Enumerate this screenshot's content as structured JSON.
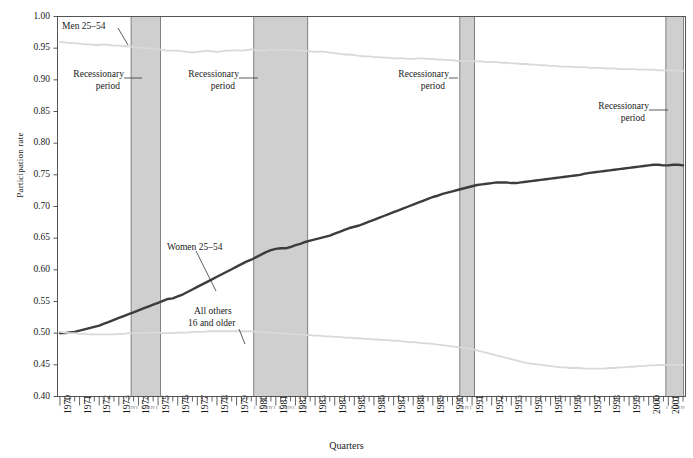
{
  "chart_data": {
    "type": "line",
    "title": "",
    "xlabel": "Quarters",
    "ylabel": "Participation rate",
    "ylim": [
      0.4,
      1.0
    ],
    "ytick_labels": [
      "0.40",
      "0.45",
      "0.50",
      "0.55",
      "0.60",
      "0.65",
      "0.70",
      "0.75",
      "0.80",
      "0.85",
      "0.90",
      "0.95",
      "1.00"
    ],
    "ytick_values": [
      0.4,
      0.45,
      0.5,
      0.55,
      0.6,
      0.65,
      0.7,
      0.75,
      0.8,
      0.85,
      0.9,
      0.95,
      1.0
    ],
    "grid": false,
    "legend_position": "inline-annotations",
    "x_unit": "quarter",
    "x_start_year": 1970,
    "x_end_year": 2001,
    "xtick_years": [
      "1970",
      "1971",
      "1972",
      "1973",
      "1974",
      "1975",
      "1976",
      "1977",
      "1978",
      "1979",
      "1980",
      "1981",
      "1982",
      "1983",
      "1984",
      "1985",
      "1986",
      "1987",
      "1988",
      "1989",
      "1990",
      "1991",
      "1992",
      "1993",
      "1994",
      "1995",
      "1996",
      "1997",
      "1998",
      "1999",
      "2000",
      "2001"
    ],
    "quarter_tick_labels": [
      "I",
      "II",
      "III",
      "IV"
    ],
    "recession_bands": [
      {
        "label": "Recessionary period",
        "start_year": 1973.75,
        "end_year": 1975.25,
        "quarters": "I II III IV I II III IV"
      },
      {
        "label": "Recessionary period",
        "start_year": 1980.0,
        "end_year": 1982.75,
        "quarters": "I II III IV I II III IV I II III IV"
      },
      {
        "label": "Recessionary period",
        "start_year": 1990.5,
        "end_year": 1991.25,
        "quarters": "I II III IV"
      },
      {
        "label": "Recessionary period",
        "start_year": 2001.0,
        "end_year": 2001.9,
        "quarters": "I II III IV"
      }
    ],
    "band_color": "#cfcfcf",
    "series": [
      {
        "name": "Men 25–54",
        "color": "#d9d9d9",
        "label_text": "Men 25–54",
        "values": [
          0.96,
          0.959,
          0.958,
          0.958,
          0.957,
          0.956,
          0.956,
          0.955,
          0.955,
          0.956,
          0.955,
          0.954,
          0.954,
          0.953,
          0.953,
          0.952,
          0.951,
          0.95,
          0.95,
          0.949,
          0.948,
          0.947,
          0.946,
          0.946,
          0.946,
          0.945,
          0.944,
          0.943,
          0.944,
          0.945,
          0.946,
          0.945,
          0.944,
          0.945,
          0.946,
          0.946,
          0.947,
          0.946,
          0.947,
          0.948,
          0.947,
          0.946,
          0.947,
          0.948,
          0.947,
          0.947,
          0.948,
          0.947,
          0.946,
          0.947,
          0.946,
          0.945,
          0.944,
          0.945,
          0.944,
          0.943,
          0.942,
          0.941,
          0.94,
          0.94,
          0.939,
          0.938,
          0.937,
          0.937,
          0.936,
          0.936,
          0.935,
          0.935,
          0.934,
          0.934,
          0.934,
          0.933,
          0.933,
          0.934,
          0.934,
          0.933,
          0.933,
          0.932,
          0.932,
          0.931,
          0.931,
          0.93,
          0.93,
          0.93,
          0.929,
          0.929,
          0.929,
          0.928,
          0.928,
          0.928,
          0.927,
          0.927,
          0.926,
          0.926,
          0.925,
          0.925,
          0.924,
          0.924,
          0.923,
          0.923,
          0.922,
          0.922,
          0.921,
          0.921,
          0.921,
          0.92,
          0.92,
          0.92,
          0.919,
          0.919,
          0.919,
          0.918,
          0.918,
          0.918,
          0.917,
          0.917,
          0.917,
          0.917,
          0.916,
          0.916,
          0.916,
          0.916,
          0.915,
          0.915,
          0.915,
          0.915,
          0.914,
          0.914
        ]
      },
      {
        "name": "Women 25–54",
        "color": "#3c3c3c",
        "label_text": "Women 25–54",
        "values": [
          0.5,
          0.5,
          0.501,
          0.502,
          0.504,
          0.506,
          0.508,
          0.51,
          0.512,
          0.515,
          0.518,
          0.521,
          0.524,
          0.527,
          0.53,
          0.533,
          0.536,
          0.539,
          0.542,
          0.545,
          0.548,
          0.551,
          0.554,
          0.555,
          0.558,
          0.561,
          0.565,
          0.569,
          0.573,
          0.577,
          0.581,
          0.585,
          0.589,
          0.593,
          0.597,
          0.601,
          0.605,
          0.609,
          0.613,
          0.616,
          0.62,
          0.624,
          0.628,
          0.631,
          0.633,
          0.634,
          0.634,
          0.636,
          0.639,
          0.641,
          0.644,
          0.646,
          0.648,
          0.65,
          0.652,
          0.654,
          0.657,
          0.66,
          0.663,
          0.666,
          0.668,
          0.67,
          0.673,
          0.676,
          0.679,
          0.682,
          0.685,
          0.688,
          0.691,
          0.694,
          0.697,
          0.7,
          0.703,
          0.706,
          0.709,
          0.712,
          0.715,
          0.717,
          0.72,
          0.722,
          0.724,
          0.726,
          0.728,
          0.73,
          0.732,
          0.734,
          0.735,
          0.736,
          0.737,
          0.738,
          0.738,
          0.738,
          0.737,
          0.737,
          0.738,
          0.739,
          0.74,
          0.741,
          0.742,
          0.743,
          0.744,
          0.745,
          0.746,
          0.747,
          0.748,
          0.749,
          0.75,
          0.752,
          0.753,
          0.754,
          0.755,
          0.756,
          0.757,
          0.758,
          0.759,
          0.76,
          0.761,
          0.762,
          0.763,
          0.764,
          0.765,
          0.766,
          0.766,
          0.765,
          0.765,
          0.766,
          0.766,
          0.765
        ]
      },
      {
        "name": "All others 16 and older",
        "color": "#d9d9d9",
        "label_text": "All others\n16 and older",
        "values": [
          0.502,
          0.501,
          0.5,
          0.5,
          0.499,
          0.499,
          0.498,
          0.498,
          0.498,
          0.498,
          0.498,
          0.498,
          0.499,
          0.499,
          0.5,
          0.5,
          0.5,
          0.5,
          0.501,
          0.501,
          0.501,
          0.5,
          0.5,
          0.5,
          0.501,
          0.501,
          0.501,
          0.502,
          0.502,
          0.502,
          0.503,
          0.503,
          0.503,
          0.503,
          0.503,
          0.503,
          0.503,
          0.503,
          0.503,
          0.503,
          0.502,
          0.502,
          0.501,
          0.501,
          0.5,
          0.5,
          0.499,
          0.499,
          0.498,
          0.498,
          0.497,
          0.497,
          0.496,
          0.496,
          0.495,
          0.495,
          0.494,
          0.494,
          0.493,
          0.493,
          0.492,
          0.492,
          0.491,
          0.491,
          0.49,
          0.49,
          0.489,
          0.489,
          0.488,
          0.488,
          0.487,
          0.486,
          0.486,
          0.485,
          0.484,
          0.484,
          0.483,
          0.482,
          0.481,
          0.48,
          0.479,
          0.478,
          0.477,
          0.476,
          0.475,
          0.473,
          0.471,
          0.469,
          0.467,
          0.465,
          0.463,
          0.461,
          0.459,
          0.457,
          0.455,
          0.453,
          0.452,
          0.451,
          0.45,
          0.449,
          0.448,
          0.447,
          0.446,
          0.446,
          0.445,
          0.445,
          0.445,
          0.444,
          0.444,
          0.444,
          0.444,
          0.444,
          0.445,
          0.445,
          0.446,
          0.446,
          0.447,
          0.447,
          0.448,
          0.448,
          0.449,
          0.449,
          0.45,
          0.45,
          0.45,
          0.45,
          0.45,
          0.45
        ]
      }
    ],
    "annotations": [
      {
        "name": "men-label",
        "text": "Men 25–54"
      },
      {
        "name": "women-label",
        "text": "Women 25–54"
      },
      {
        "name": "all-others-label-line1",
        "text": "All others"
      },
      {
        "name": "all-others-label-line2",
        "text": "16 and older"
      },
      {
        "name": "recession-label-1-line1",
        "text": "Recessionary"
      },
      {
        "name": "recession-label-1-line2",
        "text": "period"
      },
      {
        "name": "recession-label-2-line1",
        "text": "Recessionary"
      },
      {
        "name": "recession-label-2-line2",
        "text": "period"
      },
      {
        "name": "recession-label-3-line1",
        "text": "Recessionary"
      },
      {
        "name": "recession-label-3-line2",
        "text": "period"
      },
      {
        "name": "recession-label-4-line1",
        "text": "Recessionary"
      },
      {
        "name": "recession-label-4-line2",
        "text": "period"
      }
    ]
  }
}
